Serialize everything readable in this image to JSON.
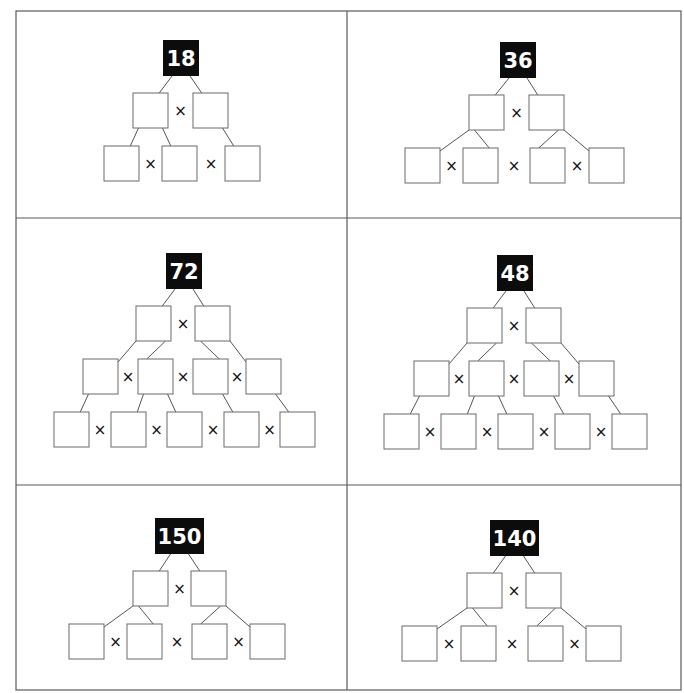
{
  "worksheet": {
    "border_color": "#5a5a5a",
    "root_fill": "#0c0c0c",
    "root_text_color": "#ffffff",
    "operator": "×",
    "frame": {
      "x": 16,
      "y": 11,
      "w": 665,
      "h": 679
    },
    "dividers": {
      "vertical_x": 347,
      "horizontal_y": [
        218,
        485
      ]
    },
    "box_size": 35,
    "trees": [
      {
        "panel": "top-left",
        "root": {
          "label": "18",
          "x": 163,
          "y": 40,
          "w": 36
        },
        "levels": [
          {
            "y": 93,
            "xs": [
              133,
              193
            ],
            "times_between": [
              true
            ]
          },
          {
            "y": 146,
            "xs": [
              104,
              162,
              225
            ],
            "times_between": [
              true,
              true
            ]
          }
        ],
        "links": [
          [
            "r",
            0,
            0
          ],
          [
            "r",
            0,
            1
          ],
          [
            0,
            0,
            0
          ],
          [
            0,
            0,
            1
          ],
          [
            0,
            1,
            2
          ]
        ]
      },
      {
        "panel": "top-right",
        "root": {
          "label": "36",
          "x": 500,
          "y": 42,
          "w": 36
        },
        "levels": [
          {
            "y": 95,
            "xs": [
              469,
              529
            ],
            "times_between": [
              true
            ]
          },
          {
            "y": 148,
            "xs": [
              405,
              463,
              530,
              589
            ],
            "times_between": [
              true,
              true,
              true
            ]
          }
        ],
        "links": [
          [
            "r",
            0,
            0
          ],
          [
            "r",
            0,
            1
          ],
          [
            0,
            0,
            0
          ],
          [
            0,
            0,
            1
          ],
          [
            0,
            1,
            2
          ],
          [
            0,
            1,
            3
          ]
        ]
      },
      {
        "panel": "middle-left",
        "root": {
          "label": "72",
          "x": 166,
          "y": 253,
          "w": 36
        },
        "levels": [
          {
            "y": 306,
            "xs": [
              136,
              195
            ],
            "times_between": [
              true
            ]
          },
          {
            "y": 359,
            "xs": [
              83,
              138,
              193,
              246
            ],
            "times_between": [
              true,
              true,
              true
            ]
          },
          {
            "y": 412,
            "xs": [
              54,
              111,
              167,
              224,
              280
            ],
            "times_between": [
              true,
              true,
              true,
              true
            ]
          }
        ],
        "links": [
          [
            "r",
            0,
            0
          ],
          [
            "r",
            0,
            1
          ],
          [
            0,
            0,
            0
          ],
          [
            0,
            0,
            1
          ],
          [
            0,
            1,
            2
          ],
          [
            0,
            1,
            3
          ],
          [
            1,
            0,
            0
          ],
          [
            1,
            1,
            1
          ],
          [
            1,
            1,
            2
          ],
          [
            1,
            2,
            3
          ],
          [
            1,
            3,
            4
          ]
        ]
      },
      {
        "panel": "middle-right",
        "root": {
          "label": "48",
          "x": 497,
          "y": 255,
          "w": 36
        },
        "levels": [
          {
            "y": 308,
            "xs": [
              467,
              526
            ],
            "times_between": [
              true
            ]
          },
          {
            "y": 361,
            "xs": [
              414,
              469,
              524,
              579
            ],
            "times_between": [
              true,
              true,
              true
            ]
          },
          {
            "y": 414,
            "xs": [
              384,
              441,
              498,
              555,
              612
            ],
            "times_between": [
              true,
              true,
              true,
              true
            ]
          }
        ],
        "links": [
          [
            "r",
            0,
            0
          ],
          [
            "r",
            0,
            1
          ],
          [
            0,
            0,
            0
          ],
          [
            0,
            0,
            1
          ],
          [
            0,
            1,
            2
          ],
          [
            0,
            1,
            3
          ],
          [
            1,
            0,
            0
          ],
          [
            1,
            1,
            1
          ],
          [
            1,
            1,
            2
          ],
          [
            1,
            2,
            3
          ],
          [
            1,
            3,
            4
          ]
        ]
      },
      {
        "panel": "bottom-left",
        "root": {
          "label": "150",
          "x": 155,
          "y": 518,
          "w": 49
        },
        "levels": [
          {
            "y": 571,
            "xs": [
              133,
              191
            ],
            "times_between": [
              true
            ]
          },
          {
            "y": 624,
            "xs": [
              69,
              127,
              192,
              250
            ],
            "times_between": [
              true,
              true,
              true
            ]
          }
        ],
        "links": [
          [
            "r",
            0,
            0
          ],
          [
            "r",
            0,
            1
          ],
          [
            0,
            0,
            0
          ],
          [
            0,
            0,
            1
          ],
          [
            0,
            1,
            2
          ],
          [
            0,
            1,
            3
          ]
        ]
      },
      {
        "panel": "bottom-right",
        "root": {
          "label": "140",
          "x": 490,
          "y": 520,
          "w": 49
        },
        "levels": [
          {
            "y": 573,
            "xs": [
              467,
              526
            ],
            "times_between": [
              true
            ]
          },
          {
            "y": 626,
            "xs": [
              402,
              461,
              528,
              586
            ],
            "times_between": [
              true,
              true,
              true
            ]
          }
        ],
        "links": [
          [
            "r",
            0,
            0
          ],
          [
            "r",
            0,
            1
          ],
          [
            0,
            0,
            0
          ],
          [
            0,
            0,
            1
          ],
          [
            0,
            1,
            2
          ],
          [
            0,
            1,
            3
          ]
        ]
      }
    ]
  }
}
